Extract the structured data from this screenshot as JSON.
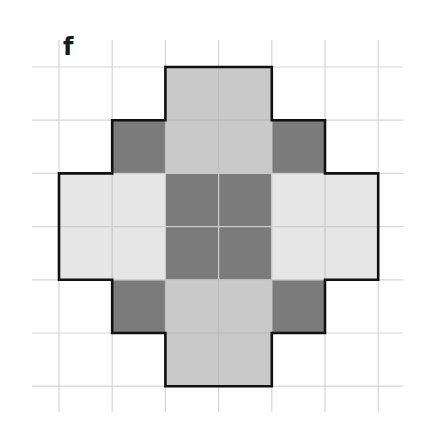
{
  "panel": {
    "label": "f"
  },
  "grid": {
    "origin_x": 59,
    "origin_y": 67,
    "cell": 53.2,
    "columns": 6,
    "rows": 6,
    "line_extend_left": 27,
    "line_extend_right": 25,
    "line_extend_top": 27,
    "line_extend_bottom": 26,
    "line_color": "#d6d6d6",
    "inner_line_color": "#e9e9e9"
  },
  "colors": {
    "dark": "#7b7b7b",
    "medium": "#c9c9c9",
    "light": "#e6e6e6",
    "outline": "#111111"
  },
  "cells": [
    {
      "col": 2,
      "row": 0,
      "tone": "medium"
    },
    {
      "col": 3,
      "row": 0,
      "tone": "medium"
    },
    {
      "col": 1,
      "row": 1,
      "tone": "dark"
    },
    {
      "col": 2,
      "row": 1,
      "tone": "medium"
    },
    {
      "col": 3,
      "row": 1,
      "tone": "medium"
    },
    {
      "col": 4,
      "row": 1,
      "tone": "dark"
    },
    {
      "col": 0,
      "row": 2,
      "tone": "light"
    },
    {
      "col": 1,
      "row": 2,
      "tone": "light"
    },
    {
      "col": 2,
      "row": 2,
      "tone": "dark"
    },
    {
      "col": 3,
      "row": 2,
      "tone": "dark"
    },
    {
      "col": 4,
      "row": 2,
      "tone": "light"
    },
    {
      "col": 5,
      "row": 2,
      "tone": "light"
    },
    {
      "col": 0,
      "row": 3,
      "tone": "light"
    },
    {
      "col": 1,
      "row": 3,
      "tone": "light"
    },
    {
      "col": 2,
      "row": 3,
      "tone": "dark"
    },
    {
      "col": 3,
      "row": 3,
      "tone": "dark"
    },
    {
      "col": 4,
      "row": 3,
      "tone": "light"
    },
    {
      "col": 5,
      "row": 3,
      "tone": "light"
    },
    {
      "col": 1,
      "row": 4,
      "tone": "dark"
    },
    {
      "col": 2,
      "row": 4,
      "tone": "medium"
    },
    {
      "col": 3,
      "row": 4,
      "tone": "medium"
    },
    {
      "col": 4,
      "row": 4,
      "tone": "dark"
    },
    {
      "col": 2,
      "row": 5,
      "tone": "medium"
    },
    {
      "col": 3,
      "row": 5,
      "tone": "medium"
    }
  ],
  "outline_path": [
    [
      2,
      0
    ],
    [
      4,
      0
    ],
    [
      4,
      1
    ],
    [
      5,
      1
    ],
    [
      5,
      2
    ],
    [
      6,
      2
    ],
    [
      6,
      4
    ],
    [
      5,
      4
    ],
    [
      5,
      5
    ],
    [
      4,
      5
    ],
    [
      4,
      6
    ],
    [
      2,
      6
    ],
    [
      2,
      5
    ],
    [
      1,
      5
    ],
    [
      1,
      4
    ],
    [
      0,
      4
    ],
    [
      0,
      2
    ],
    [
      1,
      2
    ],
    [
      1,
      1
    ],
    [
      2,
      1
    ]
  ]
}
